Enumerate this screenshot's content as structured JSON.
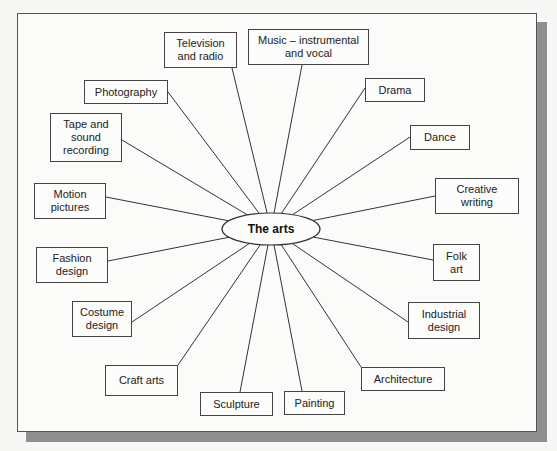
{
  "diagram": {
    "center": {
      "label": "The arts"
    },
    "nodes": [
      {
        "id": "television",
        "label": "Television\nand radio",
        "x": 164,
        "y": 32,
        "w": 73,
        "h": 36,
        "ax": 232,
        "ay": 68
      },
      {
        "id": "music",
        "label": "Music – instrumental\nand vocal",
        "x": 248,
        "y": 29,
        "w": 121,
        "h": 36,
        "ax": 302,
        "ay": 65
      },
      {
        "id": "photography",
        "label": "Photography",
        "x": 84,
        "y": 80,
        "w": 84,
        "h": 24,
        "ax": 168,
        "ay": 92
      },
      {
        "id": "drama",
        "label": "Drama",
        "x": 365,
        "y": 78,
        "w": 60,
        "h": 24,
        "ax": 365,
        "ay": 88
      },
      {
        "id": "tape",
        "label": "Tape and\nsound\nrecording",
        "x": 50,
        "y": 113,
        "w": 72,
        "h": 49,
        "ax": 122,
        "ay": 140
      },
      {
        "id": "dance",
        "label": "Dance",
        "x": 410,
        "y": 125,
        "w": 60,
        "h": 25,
        "ax": 410,
        "ay": 137
      },
      {
        "id": "creative",
        "label": "Creative\nwriting",
        "x": 435,
        "y": 178,
        "w": 84,
        "h": 36,
        "ax": 435,
        "ay": 196
      },
      {
        "id": "motion",
        "label": "Motion\npictures",
        "x": 34,
        "y": 183,
        "w": 72,
        "h": 36,
        "ax": 106,
        "ay": 197
      },
      {
        "id": "folk",
        "label": "Folk\nart",
        "x": 433,
        "y": 244,
        "w": 47,
        "h": 37,
        "ax": 433,
        "ay": 260
      },
      {
        "id": "fashion",
        "label": "Fashion\ndesign",
        "x": 36,
        "y": 247,
        "w": 72,
        "h": 36,
        "ax": 108,
        "ay": 261
      },
      {
        "id": "industrial",
        "label": "Industrial\ndesign",
        "x": 408,
        "y": 302,
        "w": 72,
        "h": 37,
        "ax": 408,
        "ay": 322
      },
      {
        "id": "costume",
        "label": "Costume\ndesign",
        "x": 72,
        "y": 301,
        "w": 60,
        "h": 36,
        "ax": 132,
        "ay": 322
      },
      {
        "id": "craft",
        "label": "Craft arts",
        "x": 105,
        "y": 365,
        "w": 73,
        "h": 31,
        "ax": 178,
        "ay": 365
      },
      {
        "id": "architecture",
        "label": "Architecture",
        "x": 361,
        "y": 367,
        "w": 84,
        "h": 24,
        "ax": 361,
        "ay": 367
      },
      {
        "id": "sculpture",
        "label": "Sculpture",
        "x": 200,
        "y": 392,
        "w": 73,
        "h": 24,
        "ax": 240,
        "ay": 392
      },
      {
        "id": "painting",
        "label": "Painting",
        "x": 284,
        "y": 391,
        "w": 61,
        "h": 24,
        "ax": 302,
        "ay": 391
      }
    ]
  },
  "styles": {
    "line_color": "#333333",
    "border_color": "#444444",
    "shadow_color": "#8f8f8f"
  }
}
